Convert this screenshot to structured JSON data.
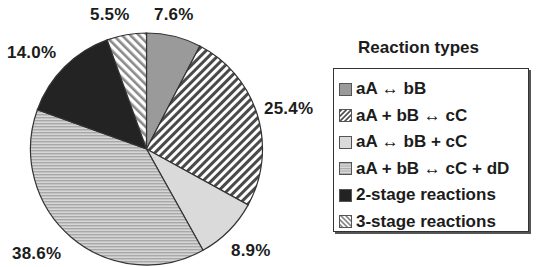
{
  "chart_data": {
    "type": "pie",
    "title": "",
    "legend_title": "Reaction types",
    "legend_position": "right",
    "start_angle": "12 o'clock",
    "direction": "clockwise",
    "categories": [
      "aA ↔ bB",
      "aA + bB ↔ cC",
      "aA ↔ bB + cC",
      "aA + bB ↔ cC + dD",
      "2-stage reactions",
      "3-stage reactions"
    ],
    "values": [
      7.6,
      25.4,
      8.9,
      38.6,
      14.0,
      5.5
    ],
    "labels": [
      "7.6%",
      "25.4%",
      "8.9%",
      "38.6%",
      "14.0%",
      "5.5%"
    ],
    "fills": [
      {
        "pattern": "solid",
        "color": "#9a9a9a"
      },
      {
        "pattern": "diagonal-forward",
        "color": "#4a4a4a"
      },
      {
        "pattern": "solid",
        "color": "#dadada"
      },
      {
        "pattern": "horizontal",
        "color": "#b5b5b5"
      },
      {
        "pattern": "solid",
        "color": "#232323"
      },
      {
        "pattern": "diagonal-back",
        "color": "#8a8a8a"
      }
    ]
  },
  "legend": {
    "title": "Reaction types",
    "items": [
      {
        "label": "aA ↔ bB",
        "swatch": "solid-gray"
      },
      {
        "label": "aA + bB ↔ cC",
        "swatch": "forward-hatch"
      },
      {
        "label": "aA ↔ bB + cC",
        "swatch": "light-gray"
      },
      {
        "label": "aA + bB ↔ cC + dD",
        "swatch": "horizontal-lines"
      },
      {
        "label": "2-stage reactions",
        "swatch": "dark"
      },
      {
        "label": "3-stage reactions",
        "swatch": "back-hatch"
      }
    ]
  },
  "slice_labels": {
    "s0": "7.6%",
    "s1": "25.4%",
    "s2": "8.9%",
    "s3": "38.6%",
    "s4": "14.0%",
    "s5": "5.5%"
  }
}
